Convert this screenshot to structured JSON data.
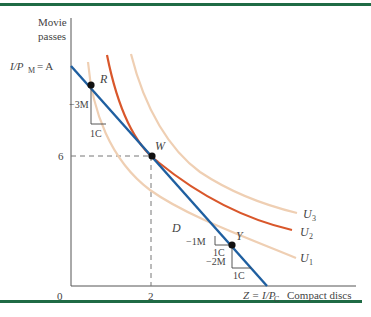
{
  "figure": {
    "type": "indifference-curve-budget-line diagram",
    "colors": {
      "rule": "#1f6b45",
      "budget_line": "#1f5fa0",
      "u2": "#d9572b",
      "u1_u3": "#efcfb3",
      "axis": "#555555",
      "dashed": "#777777"
    },
    "axes": {
      "y_label_line1": "Movie",
      "y_label_line2": "passes",
      "x_label": "Compact discs",
      "origin": "0",
      "y_intercept_label": "I/P",
      "y_intercept_sub": "M",
      "y_intercept_value": " = A",
      "y_tick": "6",
      "x_tick": "2",
      "x_intercept_label": "Z = I/P",
      "x_intercept_sub": "C"
    },
    "points": [
      {
        "name": "R"
      },
      {
        "name": "W"
      },
      {
        "name": "Y"
      }
    ],
    "region_label": "D",
    "curves": [
      {
        "name": "U",
        "sub": "1"
      },
      {
        "name": "U",
        "sub": "2"
      },
      {
        "name": "U",
        "sub": "3"
      }
    ],
    "annotations": {
      "r_drop": "−3M",
      "r_run": "1C",
      "y_left_drop": "−1M",
      "y_left_run": "1C",
      "y_right_drop": "−2M",
      "y_right_run": "1C"
    }
  }
}
